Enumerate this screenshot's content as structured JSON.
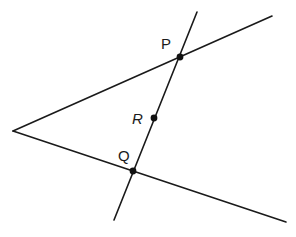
{
  "diagram": {
    "stroke_color": "#1a1a1a",
    "background": "#ffffff",
    "vertex": {
      "x": 13,
      "y": 131
    },
    "rays": [
      {
        "name": "upper-ray",
        "from": [
          13,
          131
        ],
        "to": [
          272,
          16
        ]
      },
      {
        "name": "lower-ray",
        "from": [
          13,
          131
        ],
        "to": [
          286,
          222
        ]
      }
    ],
    "transversal": {
      "from": [
        197,
        12
      ],
      "to": [
        114,
        220
      ]
    },
    "points": [
      {
        "label": "P",
        "x": 180,
        "y": 57,
        "label_x": 161,
        "label_y": 49,
        "italic": false
      },
      {
        "label": "R",
        "x": 154,
        "y": 118,
        "label_x": 132,
        "label_y": 124,
        "italic": true
      },
      {
        "label": "Q",
        "x": 133,
        "y": 171,
        "label_x": 118,
        "label_y": 161,
        "italic": false
      }
    ]
  }
}
